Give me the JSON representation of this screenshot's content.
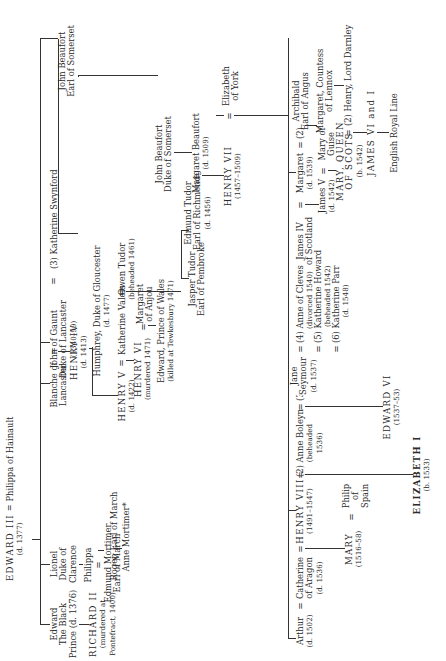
{
  "diagram": {
    "type": "genealogical-tree",
    "orientation": "rotated-90-ccw",
    "root": {
      "king": "EDWARD III",
      "king_dates": "(d. 1377)",
      "consort": "Philippa of Hainault"
    },
    "gen2": {
      "edward_black_prince": [
        "Edward",
        "The Black",
        "Prince (d. 1376)"
      ],
      "lionel": [
        "Lionel",
        "Duke of",
        "Clarence"
      ],
      "blanche": [
        "Blanche of",
        "Lancaster"
      ],
      "john_of_gaunt": [
        "John of Gaunt",
        "Duke of Lancaster",
        "(1340–99)"
      ],
      "katherine_swynford": "(3) Katherine Swynford"
    },
    "gen3": {
      "richard_ii": [
        "RICHARD II",
        "(murdered at",
        "Pontefract, 1400)"
      ],
      "philippa": "Philippa",
      "edmund_mortimer": [
        "Edmund Mortimer",
        "Earl of March"
      ],
      "henry_iv": [
        "HENRY IV",
        "(d. 1413)"
      ],
      "john_beaufort_earl": [
        "John Beaufort",
        "Earl of Somerset"
      ]
    },
    "gen4": {
      "roger_mortimer": "Roger, Earl of March",
      "anne_mortimer": "Anne Mortimer*",
      "henry_v": [
        "HENRY V",
        "(d. 1422)"
      ],
      "katherine_valois": "Katherine Valois",
      "owen_tudor": [
        "Owen Tudor",
        "(beheaded 1461)"
      ],
      "humphrey": [
        "Humphrey, Duke of Gloucester",
        "(d. 1477)"
      ],
      "john_beaufort_duke": [
        "John Beaufort",
        "Duke of Somerset"
      ]
    },
    "gen5": {
      "henry_vi": [
        "HENRY VI",
        "(murdered 1471)"
      ],
      "margaret_anjou": [
        "Margaret",
        "of Anjou"
      ],
      "edward_prince_wales": [
        "Edward, Prince of Wales",
        "(killed at Tewkesbury 1471)"
      ],
      "jasper_tudor": [
        "Jasper Tudor",
        "Earl of Pembroke"
      ],
      "edmund_tudor": [
        "Edmund Tudor",
        "Earl of Richmond",
        "(d. 1456)"
      ],
      "margaret_beaufort": [
        "Margaret Beaufort",
        "(d. 1509)"
      ]
    },
    "gen6": {
      "henry_vii": [
        "HENRY VII",
        "(1457–1509)"
      ],
      "elizabeth_york": [
        "Elizabeth",
        "of York"
      ]
    },
    "gen7": {
      "arthur": [
        "Arthur",
        "(d. 1502)"
      ],
      "catherine_aragon": [
        "Catherine",
        "of Aragon",
        "(d. 1536)"
      ],
      "henry_viii": [
        "HENRY VIII",
        "(1491–1547)"
      ],
      "anne_boleyn": [
        "(2) Anne Boleyn",
        "(beheaded",
        "1536)"
      ],
      "jane_seymour": [
        "(3)",
        "Jane",
        "Seymour",
        "(d. 1537)"
      ],
      "later_wives": [
        [
          "(4)",
          "Anne of Cleves",
          "(divorced 1540)"
        ],
        [
          "(5)",
          "Katherine Howard",
          "(beheaded 1542)"
        ],
        [
          "(6)",
          "Katherine Parr",
          "(d. 1548)"
        ]
      ],
      "james_iv": [
        "James IV",
        "of Scotland"
      ],
      "margaret_tudor": [
        "Margaret",
        "(d. 1539)"
      ],
      "archibald": [
        "(2)",
        "Archibald",
        "Earl of Angus"
      ]
    },
    "gen8": {
      "mary_i": [
        "MARY",
        "(1516–58)"
      ],
      "philip": [
        "Philip",
        "of",
        "Spain"
      ],
      "elizabeth_i": [
        "ELIZABETH I",
        "(b. 1533)"
      ],
      "edward_vi": [
        "EDWARD VI",
        "(1537–53)"
      ],
      "james_v": [
        "James V",
        "(d. 1542)"
      ],
      "mary_guise": [
        "Mary of",
        "Guise"
      ],
      "margaret_lennox": [
        "Margaret, Countess",
        "of Lennox"
      ]
    },
    "gen9": {
      "mary_queen_scots": [
        "MARY, QUEEN",
        "OF SCOTS",
        "(b. 1542)"
      ],
      "darnley": "(2) Henry, Lord Darnley"
    },
    "gen10": {
      "james_vi_i": "JAMES VI and I",
      "english_royal_line": "English Royal Line"
    },
    "marriage_symbol": "="
  }
}
